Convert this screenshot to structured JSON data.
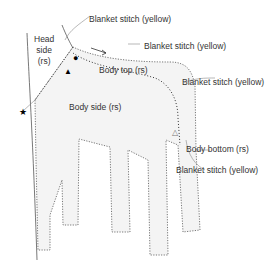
{
  "labels": {
    "head_side": [
      "Head",
      "side",
      "(rs)"
    ],
    "body_top": "Body top (rs)",
    "body_side": "Body side (rs)",
    "body_bottom": "Body bottom (rs)",
    "stitch1": "Blanket stitch (yellow)",
    "stitch2": "Blanket stitch (yellow)",
    "stitch3": "Blanket stitch (yellow)",
    "stitch4": "Blanket stitch (yellow)"
  },
  "markers": {
    "star": "★",
    "circle": "●",
    "triangle_filled": "▲",
    "triangle_open": "△"
  },
  "colors": {
    "line": "#555555",
    "fill": "#f4f4f4"
  }
}
